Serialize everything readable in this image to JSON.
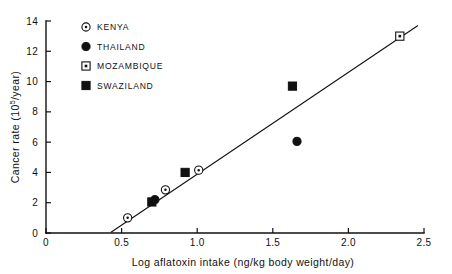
{
  "chart_data": {
    "type": "scatter",
    "title": "",
    "xlabel": "Log aflatoxin intake  (ng/kg body weight/day)",
    "ylabel": "Cancer rate  (10⁵/year)",
    "ylabel_main": "Cancer rate  (10",
    "ylabel_sup": "5",
    "ylabel_tail": "/year)",
    "xlim": [
      0,
      2.5
    ],
    "ylim": [
      0,
      14
    ],
    "xticks": [
      0,
      0.5,
      1.0,
      1.5,
      2.0,
      2.5
    ],
    "xtick_labels": [
      "0",
      "0.5",
      "1.0",
      "1.5",
      "2.0",
      "2.5"
    ],
    "yticks": [
      0,
      2,
      4,
      6,
      8,
      10,
      12,
      14
    ],
    "ytick_labels": [
      "0",
      "2",
      "4",
      "6",
      "8",
      "10",
      "12",
      "14"
    ],
    "grid": false,
    "legend_position": "top-left",
    "series": [
      {
        "name": "KENYA",
        "marker": "circle-dot",
        "points": [
          {
            "x": 0.54,
            "y": 1.0
          },
          {
            "x": 0.79,
            "y": 2.85
          },
          {
            "x": 1.01,
            "y": 4.15
          }
        ]
      },
      {
        "name": "THAILAND",
        "marker": "filled-circle",
        "points": [
          {
            "x": 0.72,
            "y": 2.2
          },
          {
            "x": 1.66,
            "y": 6.05
          }
        ]
      },
      {
        "name": "MOZAMBIQUE",
        "marker": "open-square-dot",
        "points": [
          {
            "x": 2.34,
            "y": 13.0
          }
        ]
      },
      {
        "name": "SWAZILAND",
        "marker": "filled-square",
        "points": [
          {
            "x": 0.7,
            "y": 2.05
          },
          {
            "x": 0.92,
            "y": 4.0
          },
          {
            "x": 1.63,
            "y": 9.7
          }
        ]
      }
    ],
    "trend_line": {
      "x0": 0.43,
      "y0": 0.05,
      "x1": 2.46,
      "y1": 13.7
    }
  },
  "legend": {
    "entries": [
      {
        "label": "KENYA",
        "marker": "circle-dot"
      },
      {
        "label": "THAILAND",
        "marker": "filled-circle"
      },
      {
        "label": "MOZAMBIQUE",
        "marker": "open-square-dot"
      },
      {
        "label": "SWAZILAND",
        "marker": "filled-square"
      }
    ]
  },
  "colors": {
    "ink": "#111111",
    "background": "#ffffff"
  }
}
